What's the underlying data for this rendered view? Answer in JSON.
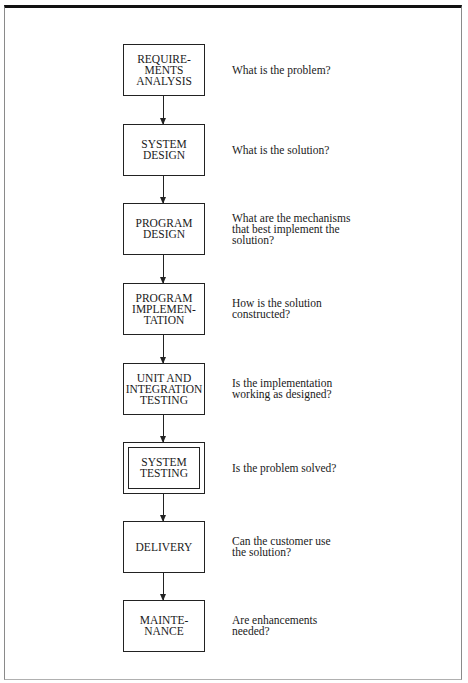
{
  "diagram": {
    "type": "flowchart",
    "orientation": "vertical",
    "stages": [
      {
        "label": "REQUIRE-\nMENTS\nANALYSIS",
        "question": "What is the problem?",
        "emphasized": false
      },
      {
        "label": "SYSTEM\nDESIGN",
        "question": "What is the solution?",
        "emphasized": false
      },
      {
        "label": "PROGRAM\nDESIGN",
        "question": "What are the mechanisms\nthat best implement the\nsolution?",
        "emphasized": false
      },
      {
        "label": "PROGRAM\nIMPLEMEN-\nTATION",
        "question": "How is the solution\nconstructed?",
        "emphasized": false
      },
      {
        "label": "UNIT AND\nINTEGRATION\nTESTING",
        "question": "Is the implementation\nworking as designed?",
        "emphasized": false
      },
      {
        "label": "SYSTEM\nTESTING",
        "question": "Is the problem solved?",
        "emphasized": true
      },
      {
        "label": "DELIVERY",
        "question": "Can the customer use\nthe solution?",
        "emphasized": false
      },
      {
        "label": "MAINTE-\nNANCE",
        "question": "Are enhancements\nneeded?",
        "emphasized": false
      }
    ],
    "edges": [
      {
        "from": 0,
        "to": 1
      },
      {
        "from": 1,
        "to": 2
      },
      {
        "from": 2,
        "to": 3
      },
      {
        "from": 3,
        "to": 4
      },
      {
        "from": 4,
        "to": 5
      },
      {
        "from": 5,
        "to": 6
      },
      {
        "from": 6,
        "to": 7
      }
    ]
  },
  "colors": {
    "line": "#222222",
    "frame_top": "#111111",
    "background": "#ffffff"
  }
}
